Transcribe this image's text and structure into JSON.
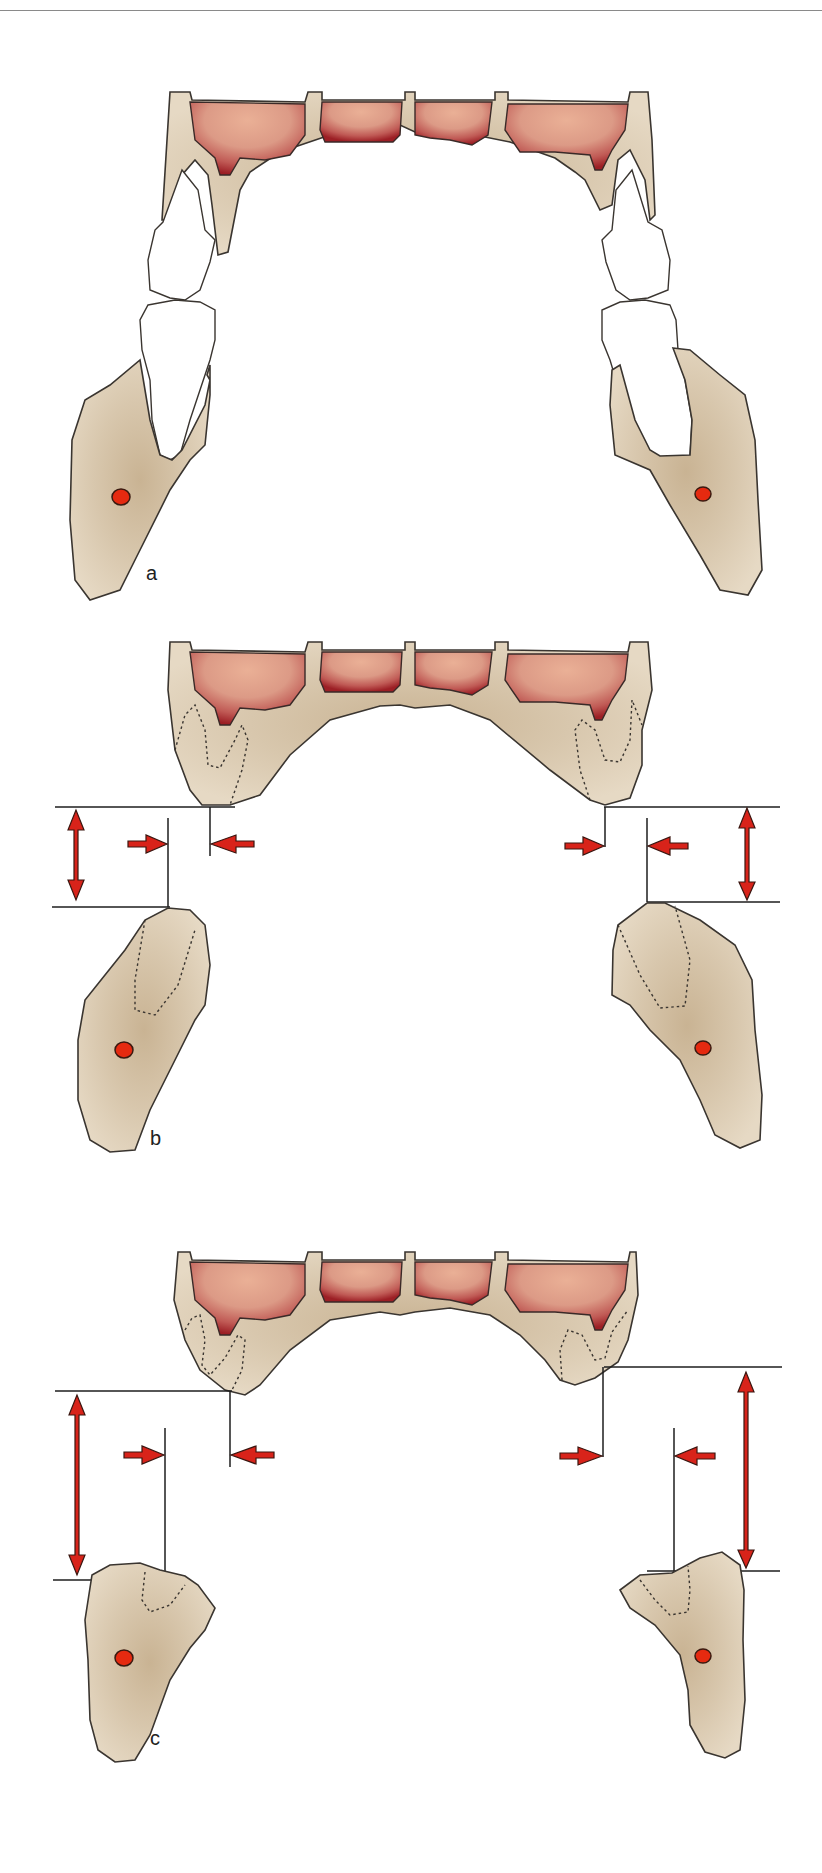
{
  "figure": {
    "panels": [
      {
        "id": "a",
        "label": "a",
        "state": "dentate - teeth in occlusion, upper and lower jaw sections with teeth"
      },
      {
        "id": "b",
        "label": "b",
        "state": "edentulous - moderate resorption, vertical and horizontal gap indicated"
      },
      {
        "id": "c",
        "label": "c",
        "state": "edentulous - advanced resorption, larger vertical gap indicated"
      }
    ],
    "colors": {
      "bone": "#d9c8ae",
      "bone_dark": "#bfa888",
      "sinus_light": "#e8a88c",
      "sinus_dark": "#a8242a",
      "nerve": "#e52a10",
      "arrow": "#d8231a",
      "line": "#1e1e1e",
      "rule": "#8a8a8a"
    },
    "icons": {
      "vertical_double_arrow": "double-headed vertical arrow (inter-ridge height)",
      "horizontal_arrow": "horizontal arrow pair (ridge offset)",
      "nerve_canal": "red oval (mandibular canal)"
    }
  }
}
